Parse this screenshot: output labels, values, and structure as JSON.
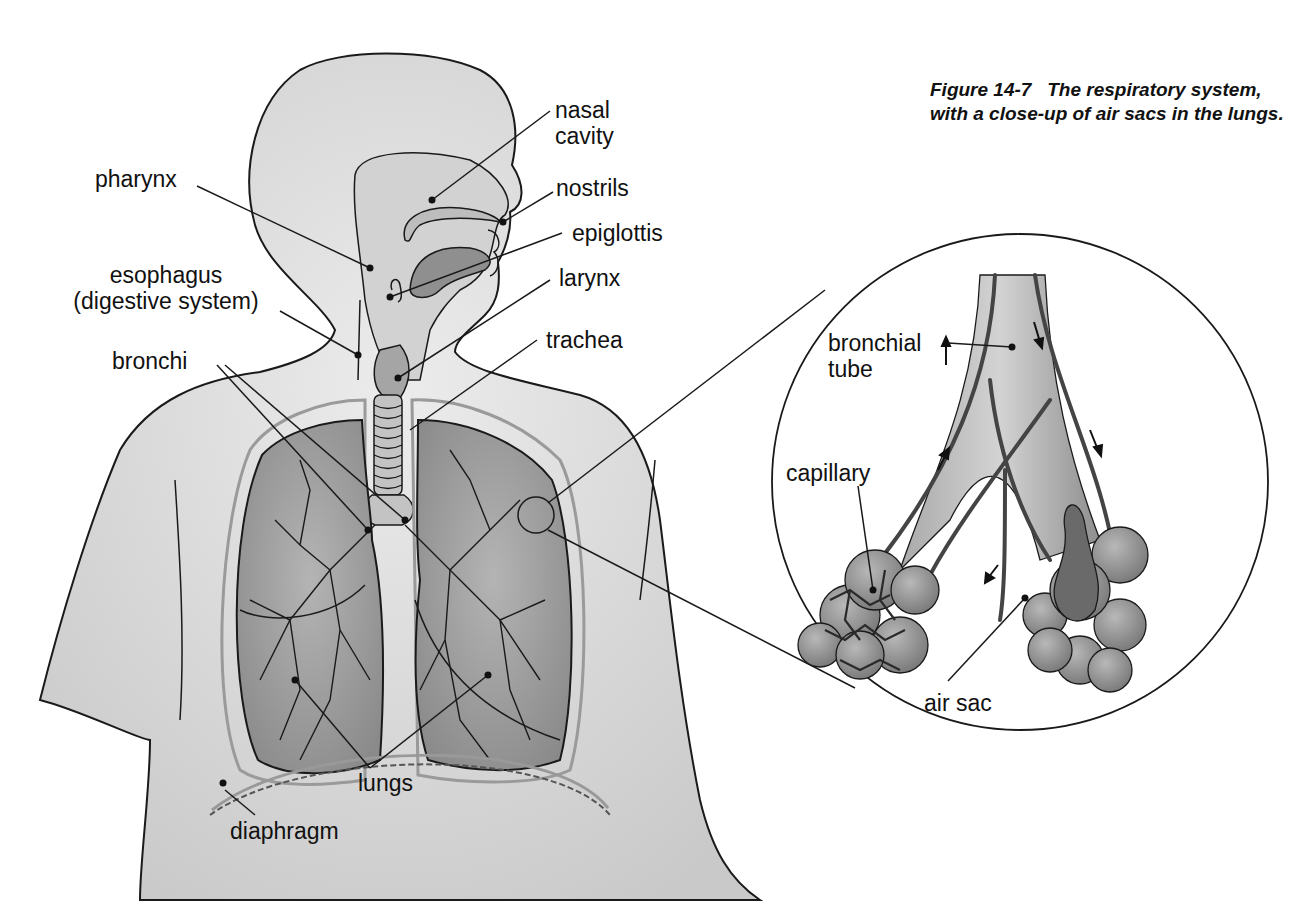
{
  "caption": {
    "figure_number": "Figure 14-7",
    "text": "The respiratory system, with a close-up of air sacs in the lungs."
  },
  "labels": {
    "nasal_cavity": [
      "nasal",
      "cavity"
    ],
    "nostrils": "nostrils",
    "epiglottis": "epiglottis",
    "larynx": "larynx",
    "trachea": "trachea",
    "pharynx": "pharynx",
    "esophagus": [
      "esophagus",
      "(digestive system)"
    ],
    "bronchi": "bronchi",
    "lungs": "lungs",
    "diaphragm": "diaphragm"
  },
  "closeup": {
    "bronchial_tube": [
      "bronchial",
      "tube"
    ],
    "capillary": "capillary",
    "air_sac": "air sac"
  },
  "colors": {
    "body_fill": "#d9d9d9",
    "lung_fill": "#9a9a9a",
    "line": "#1a1a1a",
    "background": "#ffffff"
  }
}
